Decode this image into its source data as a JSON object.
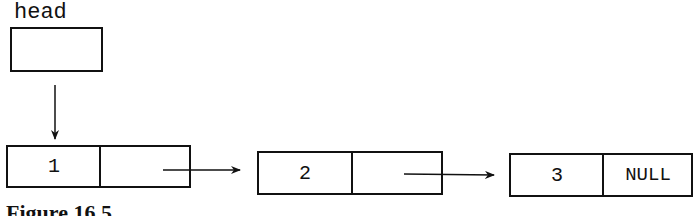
{
  "diagram": {
    "type": "singly-linked-list",
    "head": {
      "label": "head"
    },
    "nodes": [
      {
        "value": "1",
        "next": ""
      },
      {
        "value": "2",
        "next": ""
      },
      {
        "value": "3",
        "next": "NULL"
      }
    ],
    "caption": "Figure 16.5"
  }
}
